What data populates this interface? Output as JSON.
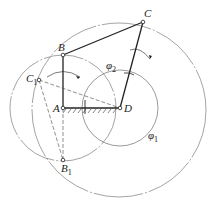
{
  "diagram": {
    "type": "four-bar linkage",
    "points": {
      "A": {
        "label": "A",
        "x": 63,
        "y": 108
      },
      "B": {
        "label": "B",
        "x": 63,
        "y": 55
      },
      "C": {
        "label": "C",
        "x": 143,
        "y": 22
      },
      "D": {
        "label": "D",
        "x": 120,
        "y": 108
      },
      "C1": {
        "label": "C",
        "sub": "1",
        "x": 39,
        "y": 80
      },
      "B1": {
        "label": "B",
        "sub": "1",
        "x": 63,
        "y": 160
      }
    },
    "angles": {
      "phi1": {
        "label": "φ",
        "sub": "1"
      },
      "phi2": {
        "label": "φ",
        "sub": "2"
      }
    },
    "colors": {
      "line": "#222222",
      "circle": "#555555"
    }
  }
}
